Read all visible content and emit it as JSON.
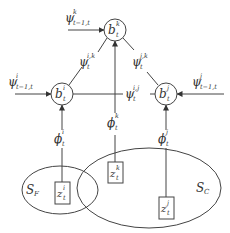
{
  "diagram": {
    "type": "graphical-model",
    "colors": {
      "line": "#444444",
      "text": "#333333",
      "background": "#ffffff"
    },
    "nodes": {
      "b_k": {
        "base": "b",
        "sup": "k",
        "sub": "t"
      },
      "b_i": {
        "base": "b",
        "sup": "i",
        "sub": "t"
      },
      "b_j": {
        "base": "b",
        "sup": "j",
        "sub": "t"
      }
    },
    "inputs": {
      "psi_k_prev": {
        "base": "ψ",
        "sup": "k",
        "sub": "t−1,t"
      },
      "psi_i_prev": {
        "base": "ψ",
        "sup": "i",
        "sub": "t−1,t"
      },
      "psi_j_prev": {
        "base": "ψ",
        "sup": "j",
        "sub": "t−1,t"
      }
    },
    "edges": {
      "psi_ik": {
        "base": "ψ",
        "sup": "i,k",
        "sub": "t"
      },
      "psi_jk": {
        "base": "ψ",
        "sup": "j,k",
        "sub": "t"
      },
      "psi_ij": {
        "base": "ψ",
        "sup": "i,j",
        "sub": "t"
      }
    },
    "potentials": {
      "phi_i": {
        "base": "ϕ",
        "sup": "i",
        "sub": "t"
      },
      "phi_k": {
        "base": "ϕ",
        "sup": "k",
        "sub": "t"
      },
      "phi_j": {
        "base": "ϕ",
        "sup": "j",
        "sub": "t"
      }
    },
    "observations": {
      "z_i": {
        "base": "z",
        "sup": "i",
        "sub": "t"
      },
      "z_k": {
        "base": "z",
        "sup": "k",
        "sub": "t"
      },
      "z_j": {
        "base": "z",
        "sup": "j",
        "sub": "t"
      }
    },
    "sets": {
      "S_F": {
        "base": "S",
        "sub": "F"
      },
      "S_C": {
        "base": "S",
        "sub": "C"
      }
    }
  }
}
